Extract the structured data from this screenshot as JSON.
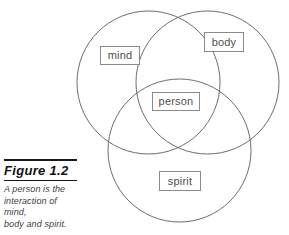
{
  "figure": {
    "caption_title": "Figure 1.2",
    "caption_lines": [
      "A person is the",
      "interaction of mind,",
      "body and spirit."
    ]
  },
  "diagram": {
    "type": "venn",
    "set_labels": {
      "mind": "mind",
      "body": "body",
      "spirit": "spirit",
      "intersection": "person"
    },
    "colors": {
      "circle_stroke": "#6d6d6d",
      "box_border": "#8a8a8a",
      "text": "#4f4f4f",
      "rule": "#1a1a1a",
      "background": "#ffffff"
    },
    "circles": [
      {
        "name": "mind",
        "cx": 148.5,
        "cy": 82.5,
        "r": 71.5
      },
      {
        "name": "body",
        "cx": 207.5,
        "cy": 82.5,
        "r": 71.5
      },
      {
        "name": "spirit",
        "cx": 179.5,
        "cy": 150.5,
        "r": 71.5
      }
    ]
  }
}
